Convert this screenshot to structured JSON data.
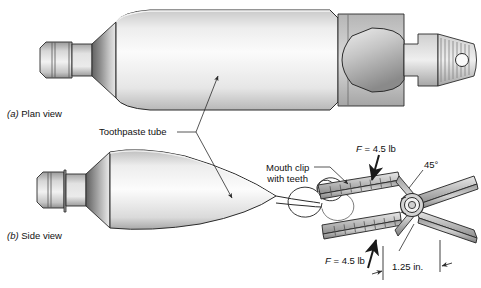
{
  "figure": {
    "kind": "engineering-illustration",
    "captions": {
      "plan_view_marker": "(a)",
      "plan_view": "Plan view",
      "side_view_marker": "(b)",
      "side_view": "Side view"
    },
    "labels": {
      "toothpaste_tube": "Toothpaste tube",
      "mouth_clip_line1": "Mouth clip",
      "mouth_clip_line2": "with teeth",
      "force_top_symbol": "F",
      "force_top_value": "= 4.5 lb",
      "force_bottom_symbol": "F",
      "force_bottom_value": "= 4.5 lb",
      "angle": "45°",
      "dimension": "1.25 in."
    },
    "colors": {
      "outline": "#2b2b2b",
      "tube_body_light": "#fbfbfb",
      "tube_body_mid": "#dcdcdc",
      "shoulder_dark": "#6f6f6f",
      "cap_gray": "#b9b9b9",
      "clip_gray": "#a9a9a9",
      "clip_light": "#e3e3e3",
      "text": "#111111",
      "background": "#ffffff"
    },
    "geometry_notes": {
      "views": 2,
      "forces_count": 2,
      "angle_degrees": 45,
      "dimension_inches": 1.25
    }
  }
}
